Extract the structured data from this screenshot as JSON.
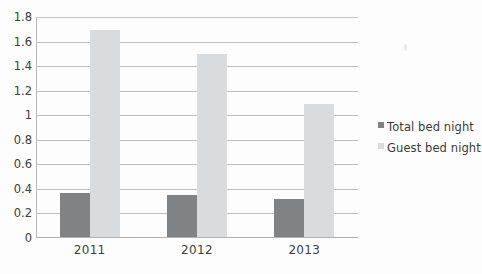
{
  "chart_data": {
    "type": "bar",
    "title": "",
    "xlabel": "",
    "ylabel": "",
    "categories": [
      "2011",
      "2012",
      "2013"
    ],
    "series": [
      {
        "name": "Total bed night",
        "color": "#808284",
        "values": [
          0.36,
          0.34,
          0.31
        ]
      },
      {
        "name": "Guest bed night",
        "color": "#d9dbdc",
        "values": [
          1.69,
          1.49,
          1.08
        ]
      }
    ],
    "ylim": [
      0,
      1.8
    ],
    "ytick_labels": [
      "1.8",
      "1.6",
      "1.4",
      "1.2",
      "1",
      "0.8",
      "0.6",
      "0.4",
      "0.2",
      "0"
    ],
    "ytick_values": [
      1.8,
      1.6,
      1.4,
      1.2,
      1.0,
      0.8,
      0.6,
      0.4,
      0.2,
      0
    ],
    "grid": true,
    "grid_orientation": "horizontal",
    "legend_position": "right",
    "legend": [
      "Total bed night",
      "Guest bed night"
    ]
  }
}
